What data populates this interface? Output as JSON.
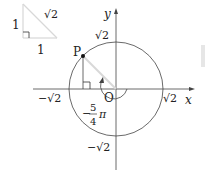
{
  "triangle": {
    "leg_vertical_label": "1",
    "leg_horizontal_label": "1",
    "hypotenuse_label": "√2"
  },
  "axes": {
    "x_label": "x",
    "y_label": "y",
    "origin_label": "O"
  },
  "circle": {
    "top_label": "√2",
    "bottom_label": "−√2",
    "left_label": "−√2",
    "right_label": "√2"
  },
  "point": {
    "label": "P"
  },
  "angle": {
    "label_sign": "−",
    "numerator": "5",
    "denominator": "4",
    "pi": "π"
  },
  "colors": {
    "line": "#333333",
    "light": "#d8d8d8",
    "side_bar": "#e6e6e6"
  }
}
